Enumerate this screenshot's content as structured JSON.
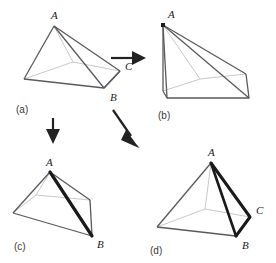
{
  "figure": {
    "title": "",
    "background_color": "#ffffff",
    "stroke_color": "#555555",
    "hidden_edge_color": "#bdbdbd",
    "highlight_color": "#1a1a1a",
    "label_color": "#1a1a1a",
    "panels": [
      {
        "id": "a",
        "caption": "(a)",
        "vertex_labels": [
          "A",
          "C",
          "B"
        ],
        "apex_label": "A",
        "right_mid_label": "C",
        "right_base_label": "B",
        "highlighted": false,
        "note": "Square pyramid drawn in oblique view; apex A at top, front-right base corner B, right side-edge midpoint C"
      },
      {
        "id": "b",
        "caption": "(b)",
        "vertex_labels": [
          "A"
        ],
        "apex_label": "A",
        "highlighted": false,
        "note": "Same pyramid tipped over so the apex A sits at upper-left and the base slopes down to the right"
      },
      {
        "id": "c",
        "caption": "(c)",
        "vertex_labels": [
          "A",
          "B"
        ],
        "apex_label": "A",
        "right_base_label": "B",
        "highlighted": true,
        "note": "Pyramid seen from a rotated angle with a bold straight segment drawn from apex A to base corner B"
      },
      {
        "id": "d",
        "caption": "(d)",
        "vertex_labels": [
          "A",
          "C",
          "B"
        ],
        "apex_label": "A",
        "right_mid_label": "C",
        "right_base_label": "B",
        "highlighted": true,
        "note": "Same view as (a) with the two-segment path A to C to B drawn in bold on the right face"
      }
    ],
    "arrows": [
      {
        "id": "arrow-a-to-b",
        "from": "a",
        "to": "b",
        "direction": "right"
      },
      {
        "id": "arrow-a-to-c",
        "from": "a",
        "to": "c",
        "direction": "down"
      },
      {
        "id": "arrow-a-to-d",
        "from": "a",
        "to": "d",
        "direction": "down-right"
      }
    ]
  }
}
